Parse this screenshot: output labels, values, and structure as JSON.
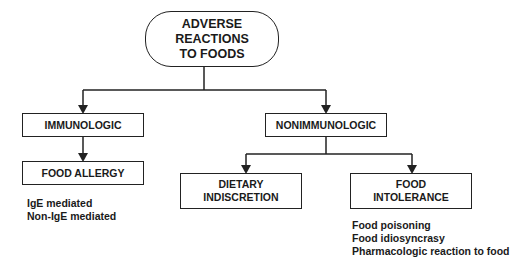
{
  "diagram": {
    "root": {
      "line1": "ADVERSE REACTIONS",
      "line2": "TO FOODS"
    },
    "branches": {
      "immunologic": {
        "label": "IMMUNOLOGIC",
        "child": {
          "label": "FOOD ALLERGY",
          "notes": [
            "IgE mediated",
            "Non-IgE mediated"
          ]
        }
      },
      "nonimmunologic": {
        "label": "NONIMMUNOLOGIC",
        "children": {
          "dietary": {
            "line1": "DIETARY",
            "line2": "INDISCRETION"
          },
          "intolerance": {
            "line1": "FOOD",
            "line2": "INTOLERANCE",
            "notes": [
              "Food poisoning",
              "Food idiosyncrasy",
              "Pharmacologic reaction to food"
            ]
          }
        }
      }
    },
    "colors": {
      "stroke": "#222222",
      "text": "#1a1a1a",
      "background": "#ffffff"
    }
  }
}
